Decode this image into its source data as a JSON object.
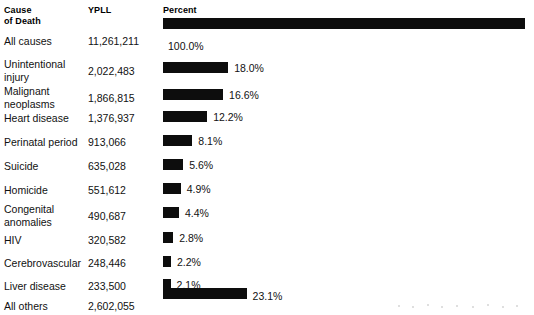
{
  "headers": {
    "cause": "Cause\nof Death",
    "cause_line1": "Cause",
    "cause_line2": "of Death",
    "ypll": "YPLL",
    "percent": "Percent"
  },
  "chart_data": {
    "type": "bar",
    "title": "",
    "xlabel": "Percent",
    "ylabel": "Cause of Death",
    "orientation": "horizontal",
    "xlim": [
      0,
      100
    ],
    "grid": false,
    "legend": null,
    "categories": [
      "All causes",
      "Unintentional injury",
      "Malignant neoplasms",
      "Heart disease",
      "Perinatal period",
      "Suicide",
      "Homicide",
      "Congenital anomalies",
      "HIV",
      "Cerebrovascular",
      "Liver disease",
      "All others"
    ],
    "values": [
      100.0,
      18.0,
      16.6,
      12.2,
      8.1,
      5.6,
      4.9,
      4.4,
      2.8,
      2.2,
      2.1,
      23.1
    ],
    "value_labels": [
      "100.0%",
      "18.0%",
      "16.6%",
      "12.2%",
      "8.1%",
      "5.6%",
      "4.9%",
      "4.4%",
      "2.8%",
      "2.2%",
      "2.1%",
      "23.1%"
    ],
    "series": [
      {
        "name": "YPLL",
        "values": [
          11261211,
          2022483,
          1866815,
          1376937,
          913066,
          635028,
          551612,
          490687,
          320582,
          248446,
          233500,
          2602055
        ],
        "value_labels": [
          "11,261,211",
          "2,022,483",
          "1,866,815",
          "1,376,937",
          "913,066",
          "635,028",
          "551,612",
          "490,687",
          "320,582",
          "248,446",
          "233,500",
          "2,602,055"
        ]
      }
    ],
    "bar_color": "#0d0d0d",
    "background_color": "#ffffff"
  },
  "rows": [
    {
      "cause_line1": "All causes",
      "cause_line2": "",
      "ypll": "11,261,211",
      "percent_label": "100.0%",
      "percent_value": 100.0,
      "label_below": true,
      "cause_top": 35,
      "ypll_top": 35,
      "bar_top": 18,
      "pct_top": 41
    },
    {
      "cause_line1": "Unintentional",
      "cause_line2": "injury",
      "ypll": "2,022,483",
      "percent_label": "18.0%",
      "percent_value": 18.0,
      "label_below": false,
      "cause_top": 58,
      "ypll_top": 65,
      "bar_top": 62,
      "pct_top": 63
    },
    {
      "cause_line1": "Malignant",
      "cause_line2": "neoplasms",
      "ypll": "1,866,815",
      "percent_label": "16.6%",
      "percent_value": 16.6,
      "label_below": false,
      "cause_top": 85,
      "ypll_top": 92,
      "bar_top": 89,
      "pct_top": 90
    },
    {
      "cause_line1": "Heart disease",
      "cause_line2": "",
      "ypll": "1,376,937",
      "percent_label": "12.2%",
      "percent_value": 12.2,
      "label_below": false,
      "cause_top": 112,
      "ypll_top": 112,
      "bar_top": 111,
      "pct_top": 112
    },
    {
      "cause_line1": "Perinatal period",
      "cause_line2": "",
      "ypll": "913,066",
      "percent_label": "8.1%",
      "percent_value": 8.1,
      "label_below": false,
      "cause_top": 136,
      "ypll_top": 136,
      "bar_top": 135,
      "pct_top": 136
    },
    {
      "cause_line1": "Suicide",
      "cause_line2": "",
      "ypll": "635,028",
      "percent_label": "5.6%",
      "percent_value": 5.6,
      "label_below": false,
      "cause_top": 160,
      "ypll_top": 160,
      "bar_top": 159,
      "pct_top": 160
    },
    {
      "cause_line1": "Homicide",
      "cause_line2": "",
      "ypll": "551,612",
      "percent_label": "4.9%",
      "percent_value": 4.9,
      "label_below": false,
      "cause_top": 184,
      "ypll_top": 184,
      "bar_top": 183,
      "pct_top": 184
    },
    {
      "cause_line1": "Congenital",
      "cause_line2": "anomalies",
      "ypll": "490,687",
      "percent_label": "4.4%",
      "percent_value": 4.4,
      "label_below": false,
      "cause_top": 203,
      "ypll_top": 210,
      "bar_top": 207,
      "pct_top": 208
    },
    {
      "cause_line1": "HIV",
      "cause_line2": "",
      "ypll": "320,582",
      "percent_label": "2.8%",
      "percent_value": 2.8,
      "label_below": false,
      "cause_top": 234,
      "ypll_top": 234,
      "bar_top": 232,
      "pct_top": 233
    },
    {
      "cause_line1": "Cerebrovascular",
      "cause_line2": "",
      "ypll": "248,446",
      "percent_label": "2.2%",
      "percent_value": 2.2,
      "label_below": false,
      "cause_top": 257,
      "ypll_top": 257,
      "bar_top": 256,
      "pct_top": 257
    },
    {
      "cause_line1": "Liver disease",
      "cause_line2": "",
      "ypll": "233,500",
      "percent_label": "2.1%",
      "percent_value": 2.1,
      "label_below": false,
      "cause_top": 280,
      "ypll_top": 280,
      "bar_top": 279,
      "pct_top": 280
    },
    {
      "cause_line1": "All others",
      "cause_line2": "",
      "ypll": "2,602,055",
      "percent_label": "23.1%",
      "percent_value": 23.1,
      "label_below": false,
      "cause_top": 300,
      "ypll_top": 300,
      "bar_top": 288,
      "pct_top": 291
    }
  ],
  "layout": {
    "bar_origin_x": 163,
    "bar_full_width": 362,
    "bar_height": 11,
    "pct_label_gap": 6
  }
}
